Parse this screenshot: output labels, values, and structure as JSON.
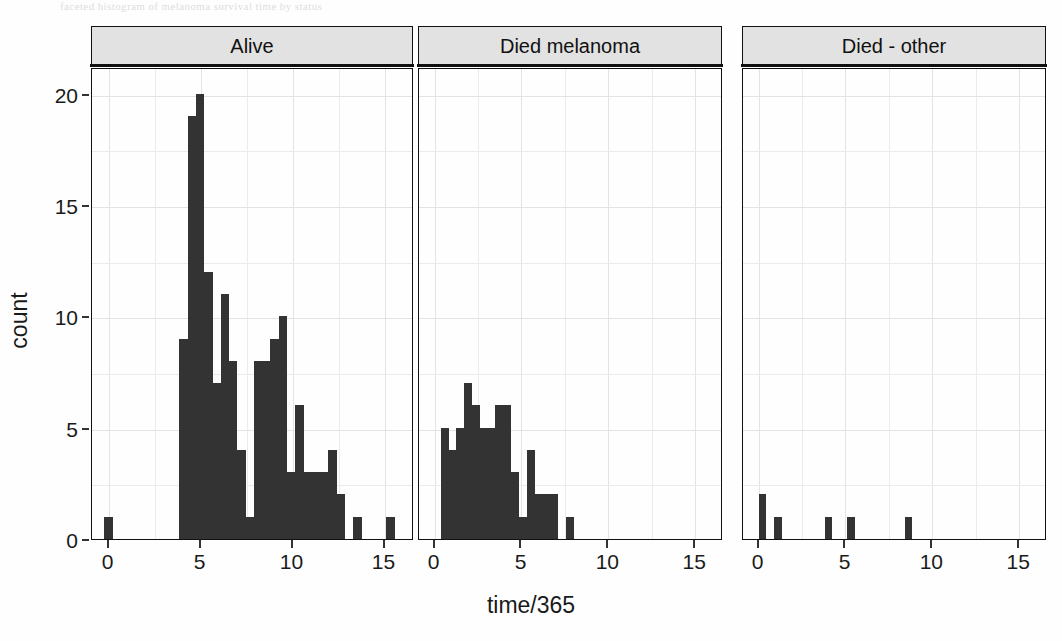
{
  "figure": {
    "title": "",
    "scan_artifact_text": "faceted histogram of melanoma survival time by status",
    "bar_color": "#333333",
    "strip_background": "#e2e2e2",
    "panel_background": "#fefefe",
    "grid_color": "#ebebeb"
  },
  "axes": {
    "xlabel": "time/365",
    "ylabel": "count",
    "xticks": [
      "0",
      "5",
      "10",
      "15"
    ],
    "xtick_values": [
      0,
      5,
      10,
      15
    ],
    "yticks": [
      "0",
      "5",
      "10",
      "15",
      "20"
    ],
    "ytick_values": [
      0,
      5,
      10,
      15,
      20
    ],
    "xlim": [
      -0.9,
      16.6
    ],
    "ylim": [
      0,
      21.2
    ]
  },
  "panels": [
    {
      "label": "Alive"
    },
    {
      "label": "Died melanoma"
    },
    {
      "label": "Died - other"
    }
  ],
  "chart_data": {
    "type": "bar",
    "subtype": "faceted-histogram",
    "title": "",
    "xlabel": "time/365",
    "ylabel": "count",
    "xlim": [
      -0.9,
      16.6
    ],
    "ylim": [
      0,
      21.2
    ],
    "grid": true,
    "legend": "none",
    "binwidth": 0.45,
    "facets": [
      {
        "name": "Alive",
        "bin_starts": [
          -0.23,
          3.85,
          4.3,
          4.75,
          5.2,
          5.65,
          6.1,
          6.55,
          7.0,
          7.45,
          7.9,
          8.35,
          8.8,
          9.25,
          9.7,
          10.15,
          10.6,
          11.05,
          11.5,
          11.95,
          12.4,
          13.3,
          15.1
        ],
        "bin_centers": [
          0.0,
          4.07,
          4.52,
          4.97,
          5.42,
          5.87,
          6.32,
          6.77,
          7.22,
          7.67,
          8.12,
          8.57,
          9.02,
          9.47,
          9.92,
          10.37,
          10.82,
          11.27,
          11.72,
          12.17,
          12.62,
          13.52,
          15.32
        ],
        "counts": [
          1,
          9,
          19,
          20,
          12,
          7,
          11,
          8,
          4,
          1,
          8,
          8,
          9,
          10,
          3,
          6,
          3,
          3,
          3,
          4,
          2,
          1,
          1
        ]
      },
      {
        "name": "Died melanoma",
        "bin_starts": [
          0.35,
          0.8,
          1.25,
          1.7,
          2.15,
          2.6,
          3.05,
          3.5,
          3.95,
          4.4,
          4.85,
          5.3,
          5.75,
          6.2,
          6.65,
          7.55
        ],
        "bin_centers": [
          0.57,
          1.02,
          1.47,
          1.92,
          2.37,
          2.82,
          3.27,
          3.72,
          4.17,
          4.62,
          5.07,
          5.52,
          5.97,
          6.42,
          6.87,
          7.77
        ],
        "counts": [
          5,
          4,
          5,
          7,
          6,
          5,
          5,
          6,
          6,
          3,
          1,
          4,
          2,
          2,
          2,
          1
        ]
      },
      {
        "name": "Died - other",
        "bin_starts": [
          0.0,
          0.9,
          3.8,
          5.1,
          8.4
        ],
        "bin_centers": [
          0.22,
          1.12,
          4.02,
          5.32,
          8.62
        ],
        "counts": [
          2,
          1,
          1,
          1,
          1
        ]
      }
    ]
  }
}
